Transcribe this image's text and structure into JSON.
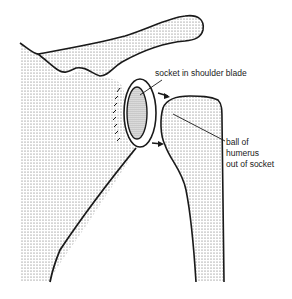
{
  "diagram": {
    "labels": {
      "socket": "socket in shoulder blade",
      "ball_line1": "ball of",
      "ball_line2": "humerus",
      "ball_line3": "out of socket"
    },
    "colors": {
      "outline": "#1a1a1a",
      "stipple": "#555555",
      "background": "#ffffff"
    }
  }
}
